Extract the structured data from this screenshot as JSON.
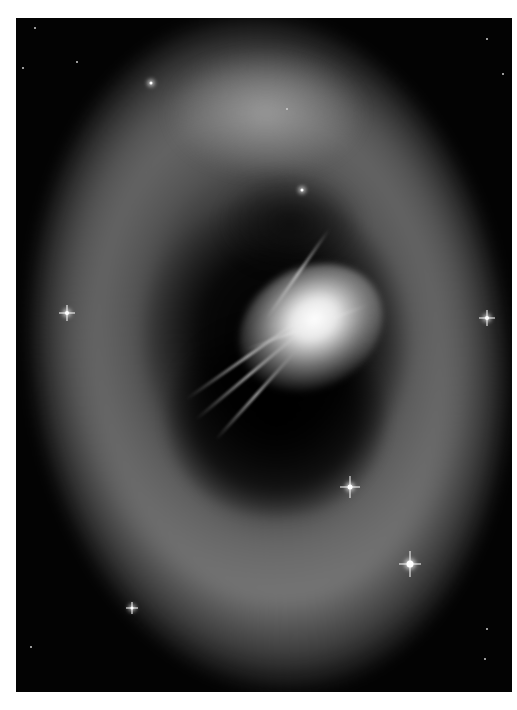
{
  "image": {
    "subject": "planetary nebula",
    "type": "grayscale astronomical photograph",
    "frame": {
      "left": 16,
      "top": 18,
      "width": 496,
      "height": 674
    },
    "colors": {
      "background": "#ffffff",
      "space": "#030303",
      "nebula": "#8a8a8a",
      "core": "#ffffff"
    }
  },
  "stars": [
    {
      "x": 51,
      "y": 295,
      "size": 12
    },
    {
      "x": 471,
      "y": 300,
      "size": 12
    },
    {
      "x": 334,
      "y": 469,
      "size": 16
    },
    {
      "x": 394,
      "y": 546,
      "size": 18
    },
    {
      "x": 116,
      "y": 590,
      "size": 10
    },
    {
      "x": 135,
      "y": 65,
      "size": 6
    },
    {
      "x": 286,
      "y": 172,
      "size": 6
    }
  ]
}
